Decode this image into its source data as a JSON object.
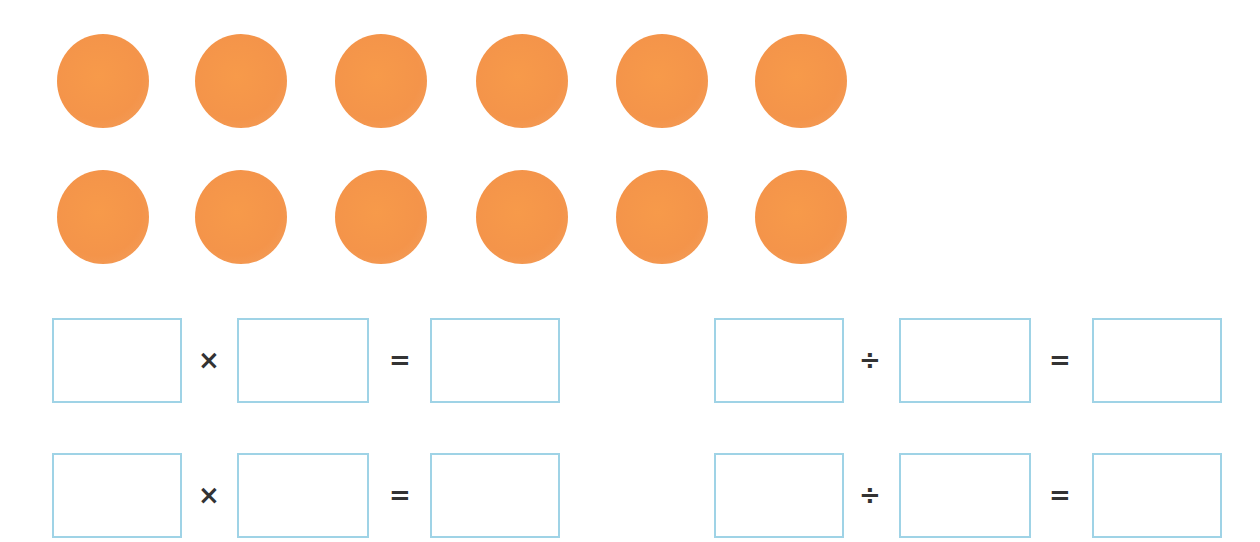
{
  "colors": {
    "dot": "#f4944a",
    "box_border": "#9fd3e6",
    "operator": "#333333"
  },
  "dots": {
    "rows": 2,
    "per_row": 6,
    "total": 12,
    "row_y": [
      34,
      170
    ],
    "col_x": [
      57,
      195,
      335,
      476,
      616,
      755
    ]
  },
  "equations": [
    {
      "name": "multiplication-1",
      "x": 52,
      "y": 318,
      "operator": "×",
      "equals": "=",
      "values": [
        "",
        "",
        ""
      ]
    },
    {
      "name": "division-1",
      "x": 714,
      "y": 318,
      "operator": "÷",
      "equals": "=",
      "values": [
        "",
        "",
        ""
      ]
    },
    {
      "name": "multiplication-2",
      "x": 52,
      "y": 453,
      "operator": "×",
      "equals": "=",
      "values": [
        "",
        "",
        ""
      ]
    },
    {
      "name": "division-2",
      "x": 714,
      "y": 453,
      "operator": "÷",
      "equals": "=",
      "values": [
        "",
        "",
        ""
      ]
    }
  ]
}
